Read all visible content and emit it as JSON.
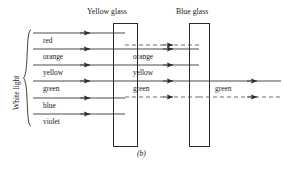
{
  "figure": {
    "caption": "(b)",
    "source_label": "White light",
    "panes": [
      {
        "name": "yellow-glass",
        "title": "Yellow glass",
        "x": 113,
        "y": 23,
        "w": 24,
        "h": 123
      },
      {
        "name": "blue-glass",
        "title": "Blue glass",
        "x": 189,
        "y": 23,
        "w": 20,
        "h": 123
      }
    ],
    "incident_rays": [
      {
        "label": "red",
        "y": 33
      },
      {
        "label": "orange",
        "y": 49
      },
      {
        "label": "yellow",
        "y": 65
      },
      {
        "label": "green",
        "y": 81
      },
      {
        "label": "blue",
        "y": 98
      },
      {
        "label": "violet",
        "y": 114
      }
    ],
    "incident_ray_start_x": 33,
    "incident_ray_end_x": 125,
    "middle_rays": [
      {
        "label": "orange",
        "y": 49
      },
      {
        "label": "yellow",
        "y": 65
      },
      {
        "label": "green",
        "y": 81
      }
    ],
    "middle_ray_start_x": 125,
    "middle_ray_end_x": 199,
    "exit_rays": [
      {
        "label": "green",
        "y": 81
      }
    ],
    "exit_ray_start_x": 199,
    "exit_ray_end_x": 281,
    "envelope_dashed_lines": [
      {
        "name": "upper-envelope",
        "x1": 125,
        "x2": 199,
        "y": 45
      },
      {
        "name": "lower-envelope",
        "x1": 125,
        "x2": 199,
        "y": 97
      },
      {
        "name": "exit-envelope",
        "x1": 199,
        "x2": 281,
        "y": 97
      }
    ],
    "bracket": {
      "x": 25,
      "y_top": 30,
      "y_bottom": 126
    },
    "colors": {
      "line": "#2b2b2b",
      "dashed": "#4a4a4a",
      "text": "#1a1a1a",
      "background": "#ffffff"
    }
  }
}
